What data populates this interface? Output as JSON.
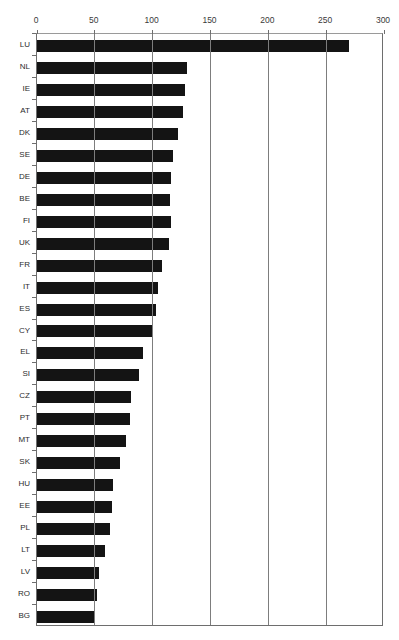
{
  "chart_data": {
    "type": "bar",
    "orientation": "horizontal",
    "title": "",
    "xlabel": "",
    "ylabel": "",
    "xlim": [
      0,
      300
    ],
    "xticks": [
      0,
      50,
      100,
      150,
      200,
      250,
      300
    ],
    "grid": true,
    "legend": false,
    "bar_color": "#141414",
    "categories": [
      "LU",
      "NL",
      "IE",
      "AT",
      "DK",
      "SE",
      "DE",
      "BE",
      "FI",
      "UK",
      "FR",
      "IT",
      "ES",
      "CY",
      "EL",
      "SI",
      "CZ",
      "PT",
      "MT",
      "SK",
      "HU",
      "EE",
      "PL",
      "LT",
      "LV",
      "RO",
      "BG"
    ],
    "values": [
      270,
      130,
      128,
      126,
      122,
      118,
      116,
      115,
      116,
      114,
      108,
      105,
      103,
      100,
      92,
      88,
      81,
      80,
      77,
      72,
      66,
      65,
      63,
      59,
      54,
      52,
      50
    ]
  },
  "top_artifact_text": ""
}
